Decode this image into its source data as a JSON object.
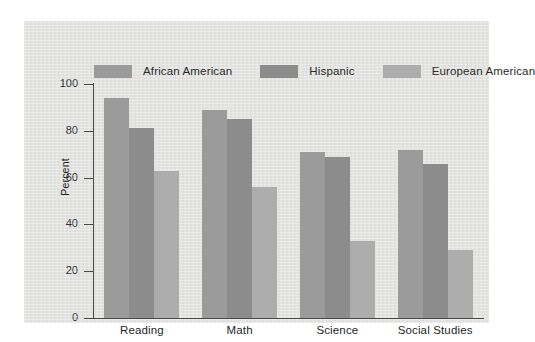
{
  "chart_data": {
    "type": "bar",
    "title": "",
    "subtitle": "",
    "xlabel": "",
    "ylabel": "Percent",
    "ylim": [
      0,
      100
    ],
    "yticks": [
      0,
      20,
      40,
      60,
      80,
      100
    ],
    "grid": false,
    "legend_position": "top",
    "categories": [
      "Reading",
      "Math",
      "Science",
      "Social Studies"
    ],
    "series": [
      {
        "name": "African American",
        "color": "#9b9b9b",
        "values": [
          94,
          89,
          71,
          72
        ]
      },
      {
        "name": "Hispanic",
        "color": "#8c8c8c",
        "values": [
          81,
          85,
          69,
          66
        ]
      },
      {
        "name": "European American",
        "color": "#adadad",
        "values": [
          63,
          56,
          33,
          29
        ]
      }
    ]
  },
  "legend": {
    "items": [
      {
        "label": "African American",
        "color": "#9b9b9b"
      },
      {
        "label": "Hispanic",
        "color": "#8c8c8c"
      },
      {
        "label": "European American",
        "color": "#adadad"
      }
    ]
  },
  "axes": {
    "y_title": "Percent",
    "y_tick_labels": [
      "100",
      "80",
      "60",
      "40",
      "20",
      "0"
    ],
    "x_tick_labels": [
      "Reading",
      "Math",
      "Science",
      "Social Studies"
    ]
  },
  "colors": {
    "panel_background": "#e4e4e2",
    "axis": "#4a4a4a",
    "text": "#222222",
    "page_background": "#ffffff"
  }
}
